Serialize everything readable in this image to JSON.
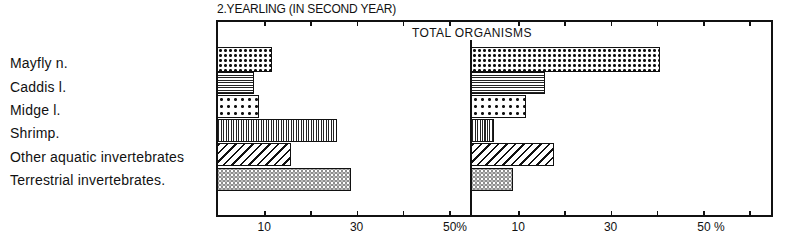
{
  "figure": {
    "title": "2.YEARLING (IN SECOND YEAR)",
    "panel_title": "TOTAL  ORGANISMS"
  },
  "categories": [
    {
      "label": "Mayfly n.",
      "pattern": "dots-dense"
    },
    {
      "label": "Caddis l.",
      "pattern": "hlines"
    },
    {
      "label": "Midge l.",
      "pattern": "dots-sparse"
    },
    {
      "label": "Shrimp.",
      "pattern": "vlines"
    },
    {
      "label": "Other aquatic invertebrates",
      "pattern": "diag"
    },
    {
      "label": "Terrestrial invertebrates.",
      "pattern": "circles"
    }
  ],
  "axes": {
    "left": {
      "ticks": [
        10,
        20,
        30,
        40,
        50
      ],
      "tick_labels": [
        "10",
        "30",
        "50%"
      ]
    },
    "right": {
      "ticks": [
        10,
        20,
        30,
        40,
        50,
        60
      ],
      "tick_labels": [
        "10",
        "30",
        "50 %"
      ]
    }
  },
  "chart_data": [
    {
      "type": "bar",
      "orientation": "horizontal",
      "title": "2.YEARLING (IN SECOND YEAR) — left panel",
      "categories": [
        "Mayfly n.",
        "Caddis l.",
        "Midge l.",
        "Shrimp.",
        "Other aquatic invertebrates",
        "Terrestrial invertebrates."
      ],
      "values": [
        12,
        8,
        9,
        26,
        16,
        29
      ],
      "xlabel": "%",
      "xticks": [
        "10",
        "30",
        "50%"
      ],
      "xlim": [
        0,
        55
      ],
      "grid": false,
      "legend": "none"
    },
    {
      "type": "bar",
      "orientation": "horizontal",
      "title": "TOTAL ORGANISMS",
      "categories": [
        "Mayfly n.",
        "Caddis l.",
        "Midge l.",
        "Shrimp.",
        "Other aquatic invertebrates",
        "Terrestrial invertebrates."
      ],
      "values": [
        41,
        16,
        12,
        5,
        18,
        9
      ],
      "xlabel": "%",
      "xticks": [
        "10",
        "30",
        "50 %"
      ],
      "xlim": [
        0,
        65
      ],
      "grid": false,
      "legend": "none"
    }
  ]
}
